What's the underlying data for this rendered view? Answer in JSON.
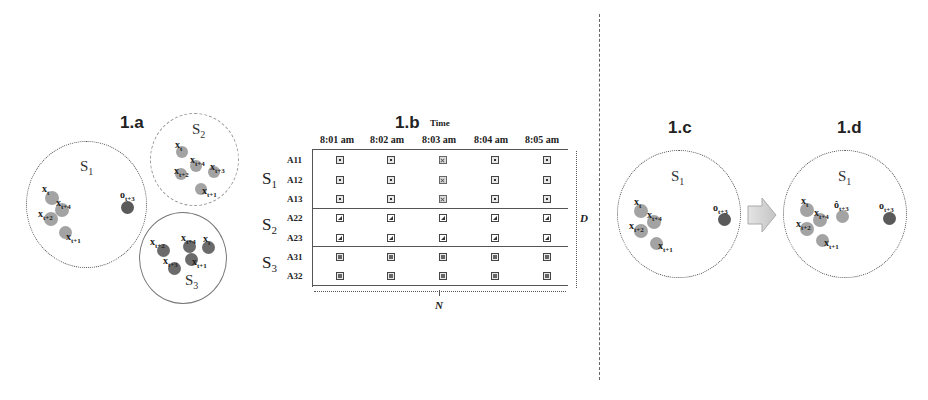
{
  "colors": {
    "normal_point": "#a3a3a3",
    "outlier_point": "#5a5a5a",
    "s3_point": "#6b6b6b",
    "ring": "#666666",
    "arrow_fill": "#cfcfcf"
  },
  "panel_a": {
    "title": "1.a",
    "sets": [
      {
        "label": "S1",
        "points": [
          "x_t^1",
          "x_{t+4}^1",
          "x_{t+2}^1",
          "x_{t+1}^1"
        ],
        "outlier": "o_{t+3}^1",
        "ring_style": "dotted"
      },
      {
        "label": "S2",
        "points": [
          "x_t^2",
          "x_{t+4}^2",
          "x_{t+2}^2",
          "x_{t+3}^2",
          "x_{t+1}^2"
        ],
        "ring_style": "dashed"
      },
      {
        "label": "S3",
        "points": [
          "x_{t+2}^3",
          "x_{t+4}^3",
          "x_t^3",
          "x_{t+3}^3",
          "x_{t+1}^3"
        ],
        "ring_style": "solid"
      }
    ]
  },
  "panel_b": {
    "title": "1.b",
    "axis_label": "Time",
    "columns": [
      "8:01 am",
      "8:02 am",
      "8:03 am",
      "8:04 am",
      "8:05 am"
    ],
    "groups": [
      {
        "label": "S1",
        "rows": [
          "A11",
          "A12",
          "A13"
        ]
      },
      {
        "label": "S2",
        "rows": [
          "A22",
          "A23"
        ]
      },
      {
        "label": "S3",
        "rows": [
          "A31",
          "A32"
        ]
      }
    ],
    "highlighted_column": "8:03 am",
    "dim_height_label": "D",
    "dim_width_label": "N"
  },
  "panel_c": {
    "title": "1.c",
    "set_label": "S1",
    "points": [
      "x_t^1",
      "x_{t+4}^1",
      "x_{t+2}^1",
      "x_{t+1}^1"
    ],
    "outlier": "o_{t+3}^1"
  },
  "panel_d": {
    "title": "1.d",
    "set_label": "S1",
    "points": [
      "x_t^1",
      "x_{t+4}^1",
      "x_{t+2}^1",
      "x_{t+1}^1"
    ],
    "imputed": "ô_{t+3}^1",
    "outlier": "o_{t+3}^1"
  },
  "text": {
    "a_title": "1.a",
    "b_title": "1.b",
    "b_time": "Time",
    "c_title": "1.c",
    "d_title": "1.d",
    "S": "S",
    "one": "1",
    "two": "2",
    "three": "3",
    "x": "x",
    "o": "o",
    "ohat": "ô",
    "t": "t",
    "t1": "t+1",
    "t2": "t+2",
    "t3": "t+3",
    "t4": "t+4",
    "col0": "8:01 am",
    "col1": "8:02 am",
    "col2": "8:03 am",
    "col3": "8:04 am",
    "col4": "8:05 am",
    "A11": "A11",
    "A12": "A12",
    "A13": "A13",
    "A22": "A22",
    "A23": "A23",
    "A31": "A31",
    "A32": "A32",
    "D": "D",
    "N": "N"
  }
}
